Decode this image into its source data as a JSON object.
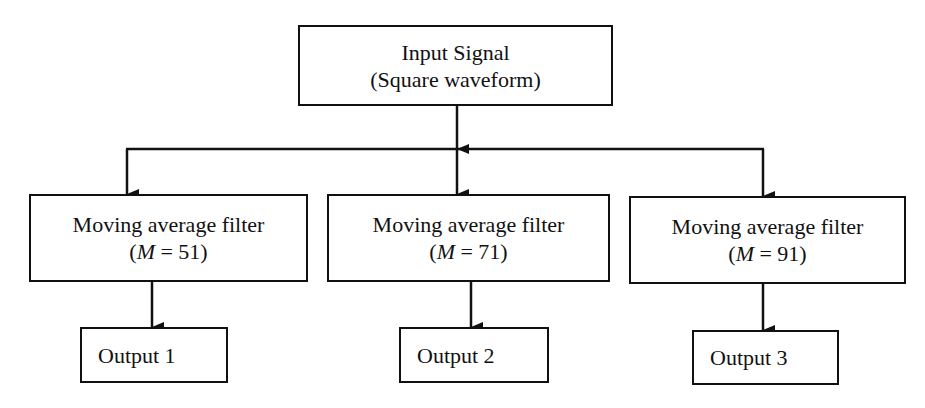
{
  "input": {
    "line1": "Input Signal",
    "line2": "(Square waveform)"
  },
  "filters": [
    {
      "label": "Moving average filter",
      "param_open": "(",
      "param_var": "M",
      "param_eq": " = 51)"
    },
    {
      "label": "Moving average filter",
      "param_open": "(",
      "param_var": "M",
      "param_eq": " = 71)"
    },
    {
      "label": "Moving average filter",
      "param_open": "(",
      "param_var": "M",
      "param_eq": " = 91)"
    }
  ],
  "outputs": [
    {
      "label": "Output 1"
    },
    {
      "label": "Output 2"
    },
    {
      "label": "Output 3"
    }
  ],
  "colors": {
    "stroke": "#111111",
    "background": "#ffffff"
  }
}
